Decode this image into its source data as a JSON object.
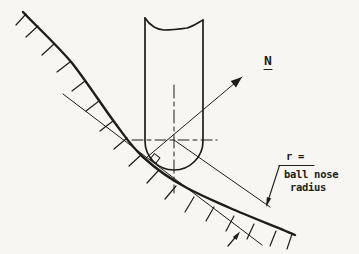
{
  "colors": {
    "ink": "#1e1d1b",
    "paper": "#f7f6f2"
  },
  "figure": {
    "normal_label": "N",
    "radius_callout": {
      "line1": "r =",
      "line2": "ball nose",
      "line3": "radius"
    }
  }
}
